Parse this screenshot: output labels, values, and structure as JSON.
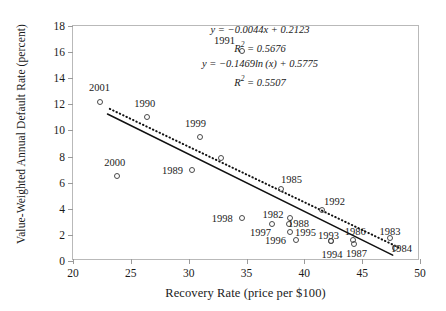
{
  "chart_data": {
    "type": "scatter",
    "title": "",
    "xlabel": "Recovery Rate (price per $100)",
    "ylabel": "Value-Weighted Annual Default Rate (percent)",
    "xlim": [
      20,
      50
    ],
    "ylim": [
      0,
      18
    ],
    "xticks": [
      20,
      25,
      30,
      35,
      40,
      45,
      50
    ],
    "yticks": [
      0,
      2,
      4,
      6,
      8,
      10,
      12,
      14,
      16,
      18
    ],
    "grid": false,
    "legend": "none",
    "marker": "open-circle",
    "points": [
      {
        "label": "2001",
        "x": 22.3,
        "y": 12.2,
        "lx": 22.3,
        "ly": 13.3
      },
      {
        "label": "1990",
        "x": 26.4,
        "y": 11.0,
        "lx": 26.2,
        "ly": 12.1
      },
      {
        "label": "2000",
        "x": 23.8,
        "y": 6.5,
        "lx": 23.6,
        "ly": 7.6
      },
      {
        "label": "1991",
        "x": 34.6,
        "y": 16.1,
        "lx": 33.1,
        "ly": 16.9
      },
      {
        "label": "1999",
        "x": 31.0,
        "y": 9.5,
        "lx": 30.6,
        "ly": 10.6
      },
      {
        "label": "1989",
        "x": 30.3,
        "y": 7.0,
        "lx": 28.6,
        "ly": 7.0
      },
      {
        "label": "",
        "x": 32.8,
        "y": 7.9,
        "lx": null,
        "ly": null
      },
      {
        "label": "1998",
        "x": 34.6,
        "y": 3.3,
        "lx": 32.9,
        "ly": 3.3
      },
      {
        "label": "1985",
        "x": 38.0,
        "y": 5.5,
        "lx": 38.9,
        "ly": 6.3
      },
      {
        "label": "1992",
        "x": 41.5,
        "y": 3.9,
        "lx": 42.6,
        "ly": 4.6
      },
      {
        "label": "1982",
        "x": 38.8,
        "y": 3.3,
        "lx": 37.3,
        "ly": 3.6
      },
      {
        "label": "1997",
        "x": 37.2,
        "y": 2.8,
        "lx": 36.2,
        "ly": 2.2
      },
      {
        "label": "1988",
        "x": 38.7,
        "y": 2.8,
        "lx": 39.5,
        "ly": 2.9
      },
      {
        "label": "1995",
        "x": 38.8,
        "y": 2.2,
        "lx": 40.1,
        "ly": 2.2
      },
      {
        "label": "1996",
        "x": 39.3,
        "y": 1.6,
        "lx": 37.5,
        "ly": 1.6
      },
      {
        "label": "1993",
        "x": 42.3,
        "y": 1.5,
        "lx": 42.1,
        "ly": 2.0
      },
      {
        "label": "1994",
        "x": 42.3,
        "y": 1.5,
        "lx": 42.4,
        "ly": 0.5
      },
      {
        "label": "1986",
        "x": 44.2,
        "y": 1.6,
        "lx": 44.4,
        "ly": 2.3
      },
      {
        "label": "1987",
        "x": 44.3,
        "y": 1.3,
        "lx": 44.5,
        "ly": 0.6
      },
      {
        "label": "1983",
        "x": 47.4,
        "y": 1.8,
        "lx": 47.4,
        "ly": 2.3
      },
      {
        "label": "1984",
        "x": 47.8,
        "y": 1.0,
        "lx": 48.4,
        "ly": 1.0
      }
    ],
    "fits": [
      {
        "type": "linear",
        "style": "solid",
        "equation": "y = −0.0044x + 0.2123",
        "r2_text": "R² = 0.5676",
        "r2": 0.5676,
        "slope": -0.0044,
        "intercept": 0.2123,
        "x_start": 23.0,
        "y_start": 11.2,
        "x_end": 47.8,
        "y_end": 0.3
      },
      {
        "type": "logarithmic",
        "style": "dotted",
        "equation": "y = −0.1469ln(x) + 0.5775",
        "r2_text": "R² = 0.5507",
        "r2": 0.5507,
        "coef": -0.1469,
        "intercept": 0.5775,
        "x_start": 23.2,
        "y_start": 11.6,
        "x_end": 48.3,
        "y_end": 0.9
      }
    ],
    "equations_block": [
      "y = −0.0044x + 0.2123",
      "R² = 0.5676",
      "y = −0.1469ln (x) + 0.5775",
      "R² = 0.5507"
    ]
  },
  "colors": {
    "marker_stroke": "#4a4a4a",
    "axis": "#b9b9b9",
    "text": "#1a1a1a",
    "trend_solid": "#111111",
    "trend_dotted": "#111111",
    "background": "#ffffff"
  }
}
